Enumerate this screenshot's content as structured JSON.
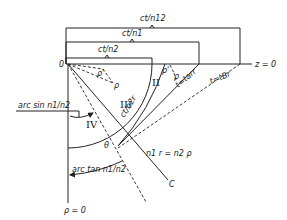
{
  "diagram": {
    "brackets": {
      "ct_n12": "ct/n12",
      "ct_n1": "ct/n1",
      "ct_n2": "ct/n2"
    },
    "origin_label": "0",
    "z_axis_label": "z = 0",
    "rho_axis_label": "ρ = 0",
    "regions": {
      "II": "II",
      "III": "III",
      "IV": "IV"
    },
    "labels": {
      "rho_prime_left": "ρ'",
      "rho_left": "ρ",
      "rho_prime_right": "ρ'",
      "rho_right": "ρ",
      "t_arr": "t=tarr",
      "t_br": "t=tBr",
      "ct_n2_arc": "ct/n2r",
      "theta": "θ",
      "arcsin": "arc sin n1/n2",
      "arctan": "arc tan n1/n2",
      "line_eq": "n1 r = n2 ρ",
      "point_c": "C"
    }
  }
}
